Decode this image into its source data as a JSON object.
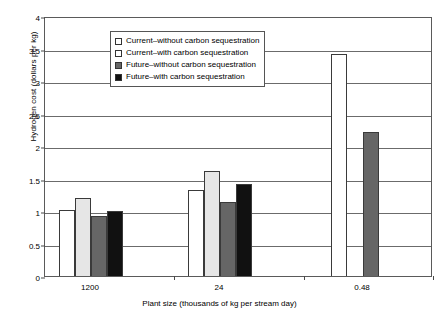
{
  "chart_data": {
    "type": "bar",
    "title": "",
    "xlabel": "Plant size (thousands of kg per stream day)",
    "ylabel": "Hydrogen cost (dollars per kg)",
    "categories": [
      "1200",
      "24",
      "0.48"
    ],
    "ylim": [
      0,
      4
    ],
    "ytick_labels": [
      "0",
      "0.5",
      "1",
      "1.5",
      "2",
      "2.5",
      "3",
      "3.5",
      "4"
    ],
    "ytick_values": [
      0,
      0.5,
      1,
      1.5,
      2,
      2.5,
      3,
      3.5,
      4
    ],
    "grid": true,
    "legend_position": "upper-left-inside",
    "series": [
      {
        "name": "Current–without carbon sequestration",
        "color": "#ffffff",
        "values": [
          1.02,
          1.33,
          3.41
        ]
      },
      {
        "name": "Current–with carbon sequestration",
        "color": "#e6e6e6",
        "values": [
          1.2,
          1.61,
          null
        ]
      },
      {
        "name": "Future–without carbon sequestration",
        "color": "#666666",
        "values": [
          0.92,
          1.14,
          2.22
        ]
      },
      {
        "name": "Future–with carbon sequestration",
        "color": "#111111",
        "values": [
          1.0,
          1.42,
          null
        ]
      }
    ]
  },
  "legend": {
    "items": [
      {
        "label": "Current–without carbon sequestration",
        "swatch": "#ffffff"
      },
      {
        "label": "Current–with carbon sequestration",
        "swatch": "#ffffff"
      },
      {
        "label": "Future–without carbon sequestration",
        "swatch": "#666666"
      },
      {
        "label": "Future–with carbon sequestration",
        "swatch": "#111111"
      }
    ]
  }
}
